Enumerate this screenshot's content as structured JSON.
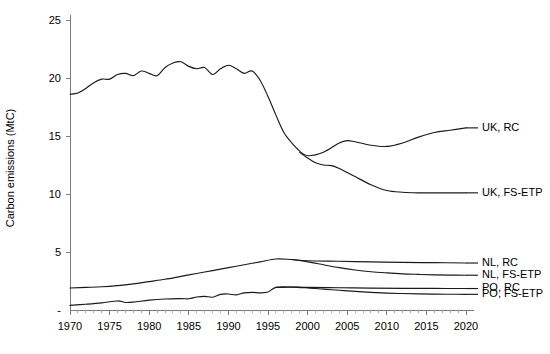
{
  "chart_data": {
    "type": "line",
    "title": "",
    "xlabel": "",
    "ylabel": "Carbon emissions (MtC)",
    "xlim": [
      1970,
      2020
    ],
    "ylim": [
      0,
      25
    ],
    "grid": false,
    "legend_position": "right-inline-labels",
    "x_ticks": [
      1970,
      1975,
      1980,
      1985,
      1990,
      1995,
      2000,
      2005,
      2010,
      2015,
      2020
    ],
    "x_tick_labels": [
      "1970",
      "1975",
      "1980",
      "1985",
      "1990",
      "1995",
      "2000",
      "2005",
      "2010",
      "2015",
      "2020"
    ],
    "x_minor_tick_interval": 1,
    "y_ticks": [
      0,
      5,
      10,
      15,
      20,
      25
    ],
    "y_tick_labels": [
      "-",
      "5",
      "10",
      "15",
      "20",
      "25"
    ],
    "series": [
      {
        "name": "UK, RC",
        "label": "UK, RC",
        "label_x": 2020,
        "label_y": 15.7,
        "x": [
          1970,
          1971,
          1972,
          1973,
          1974,
          1975,
          1976,
          1977,
          1978,
          1979,
          1980,
          1981,
          1982,
          1983,
          1984,
          1985,
          1986,
          1987,
          1988,
          1989,
          1990,
          1991,
          1992,
          1993,
          1994,
          1995,
          1996,
          1997,
          1998,
          1999,
          2000,
          2002,
          2004,
          2005,
          2006,
          2008,
          2010,
          2012,
          2014,
          2016,
          2018,
          2020
        ],
        "y": [
          18.6,
          18.7,
          19.1,
          19.6,
          19.9,
          19.9,
          20.3,
          20.4,
          20.2,
          20.6,
          20.4,
          20.2,
          20.9,
          21.3,
          21.4,
          21.0,
          20.8,
          20.9,
          20.3,
          20.8,
          21.1,
          20.8,
          20.4,
          20.6,
          19.8,
          18.4,
          16.8,
          15.3,
          14.4,
          13.7,
          13.3,
          13.6,
          14.4,
          14.6,
          14.5,
          14.2,
          14.1,
          14.4,
          14.9,
          15.3,
          15.5,
          15.7
        ]
      },
      {
        "name": "UK, FS-ETP",
        "label": "UK, FS-ETP",
        "label_x": 2020,
        "label_y": 10.1,
        "x": [
          1999,
          2000,
          2001,
          2002,
          2003,
          2004,
          2006,
          2008,
          2010,
          2012,
          2014,
          2016,
          2018,
          2020
        ],
        "y": [
          13.6,
          13.1,
          12.7,
          12.5,
          12.45,
          12.2,
          11.5,
          10.8,
          10.3,
          10.15,
          10.1,
          10.1,
          10.1,
          10.1
        ]
      },
      {
        "name": "NL, RC",
        "label": "NL, RC",
        "label_x": 2020,
        "label_y": 4.05,
        "x": [
          1970,
          1972,
          1974,
          1976,
          1978,
          1980,
          1982,
          1984,
          1986,
          1988,
          1990,
          1992,
          1994,
          1996,
          1998,
          2000,
          2004,
          2008,
          2012,
          2016,
          2020
        ],
        "y": [
          1.9,
          1.95,
          2.0,
          2.1,
          2.25,
          2.45,
          2.65,
          2.9,
          3.15,
          3.4,
          3.65,
          3.9,
          4.15,
          4.4,
          4.35,
          4.25,
          4.2,
          4.15,
          4.1,
          4.08,
          4.05
        ]
      },
      {
        "name": "NL, FS-ETP",
        "label": "NL, FS-ETP",
        "label_x": 2020,
        "label_y": 3.0,
        "x": [
          1998,
          2000,
          2002,
          2004,
          2006,
          2008,
          2010,
          2012,
          2014,
          2016,
          2018,
          2020
        ],
        "y": [
          4.35,
          4.15,
          3.9,
          3.65,
          3.45,
          3.3,
          3.2,
          3.12,
          3.07,
          3.03,
          3.01,
          3.0
        ]
      },
      {
        "name": "PO, RC",
        "label": "PO, RC",
        "label_x": 2020,
        "label_y": 1.85,
        "x": [
          1970,
          1972,
          1974,
          1976,
          1977,
          1978,
          1980,
          1982,
          1984,
          1985,
          1986,
          1987,
          1988,
          1989,
          1990,
          1991,
          1992,
          1993,
          1994,
          1995,
          1996,
          1998,
          2000,
          2004,
          2008,
          2012,
          2016,
          2020
        ],
        "y": [
          0.4,
          0.5,
          0.62,
          0.78,
          0.65,
          0.68,
          0.85,
          0.95,
          0.98,
          0.97,
          1.12,
          1.18,
          1.1,
          1.35,
          1.38,
          1.3,
          1.48,
          1.52,
          1.48,
          1.55,
          1.95,
          1.98,
          1.95,
          1.92,
          1.89,
          1.87,
          1.86,
          1.85
        ]
      },
      {
        "name": "PO, FS-ETP",
        "label": "PO, FS-ETP",
        "label_x": 2020,
        "label_y": 1.35,
        "x": [
          1996,
          1998,
          2000,
          2002,
          2004,
          2006,
          2008,
          2010,
          2012,
          2014,
          2016,
          2018,
          2020
        ],
        "y": [
          1.95,
          1.97,
          1.9,
          1.8,
          1.7,
          1.6,
          1.52,
          1.46,
          1.42,
          1.39,
          1.37,
          1.36,
          1.35
        ]
      }
    ]
  },
  "axes": {
    "y_title": "Carbon emissions (MtC)"
  },
  "style": {
    "line_color": "#1a1a1a",
    "axis_color": "#7a7a7a",
    "background": "#ffffff"
  }
}
